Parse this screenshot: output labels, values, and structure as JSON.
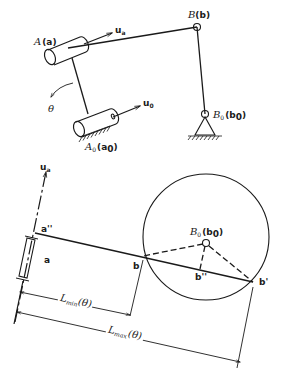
{
  "figure": {
    "top_mechanism": {
      "joint_A_label": "A",
      "joint_A_sub": "(a)",
      "joint_B_label": "B",
      "joint_B_sub": "(b)",
      "ground_A0_label": "A",
      "ground_A0_index": "0",
      "ground_A0_sub": "(a",
      "ground_A0_sub_index": "0",
      "ground_B0_label": "B",
      "ground_B0_index": "0",
      "ground_B0_sub": "(b",
      "ground_B0_sub_index": "0",
      "axis_ua_label": "u",
      "axis_ua_index": "a",
      "axis_u0_label": "u",
      "axis_u0_index": "0",
      "angle_label": "θ"
    },
    "bottom_construction": {
      "axis_ua_label": "u",
      "axis_ua_index": "a",
      "point_a_label": "a",
      "point_a2_label": "a''",
      "point_b_label": "b",
      "point_b1_label": "b'",
      "point_b2_label": "b''",
      "center_label": "B",
      "center_index": "0",
      "center_sub": "(b",
      "center_sub_index": "0",
      "dim_min_label": "L",
      "dim_min_index": "min",
      "dim_min_arg": "(θ)",
      "dim_max_label": "L",
      "dim_max_index": "max",
      "dim_max_arg": "(θ)"
    }
  }
}
